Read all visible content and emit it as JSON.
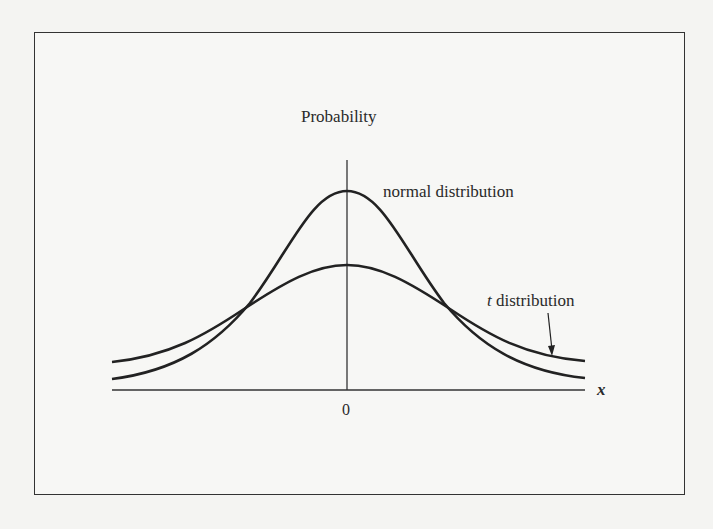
{
  "figure": {
    "y_axis_label": "Probability",
    "x_axis_label": "x",
    "x_tick_label": "0",
    "curve_labels": {
      "normal": "normal distribution",
      "t_italic": "t",
      "t_rest": " distribution"
    }
  },
  "colors": {
    "line": "#222222",
    "frame": "#333333",
    "background": "#f7f7f5"
  }
}
